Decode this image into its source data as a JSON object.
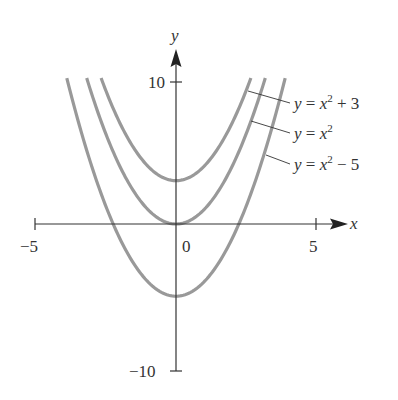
{
  "chart_data": {
    "type": "line",
    "title": "",
    "xlabel": "x",
    "ylabel": "y",
    "xlim": [
      -5,
      5
    ],
    "ylim": [
      -10,
      10
    ],
    "x_ticks": [
      {
        "value": -5,
        "label": "−5"
      },
      {
        "value": 0,
        "label": "0"
      },
      {
        "value": 5,
        "label": "5"
      }
    ],
    "y_ticks": [
      {
        "value": 10,
        "label": "10"
      },
      {
        "value": -10,
        "label": "−10"
      }
    ],
    "grid": false,
    "legend": "leader-line annotations on right",
    "series": [
      {
        "name": "y = x² + 3",
        "shift": 3,
        "vertex": [
          0,
          3
        ]
      },
      {
        "name": "y = x²",
        "shift": 0,
        "vertex": [
          0,
          0
        ]
      },
      {
        "name": "y = x² − 5",
        "shift": -5,
        "vertex": [
          0,
          -5
        ]
      }
    ],
    "curve_color": "#999999",
    "axis_color": "#333333"
  },
  "labels": {
    "x_axis": "x",
    "y_axis": "y",
    "tick_x_neg5": "−5",
    "tick_x_0": "0",
    "tick_x_5": "5",
    "tick_y_10": "10",
    "tick_y_neg10": "−10",
    "series_0": "y = x² + 3",
    "series_1": "y = x²",
    "series_2": "y = x² − 5"
  }
}
